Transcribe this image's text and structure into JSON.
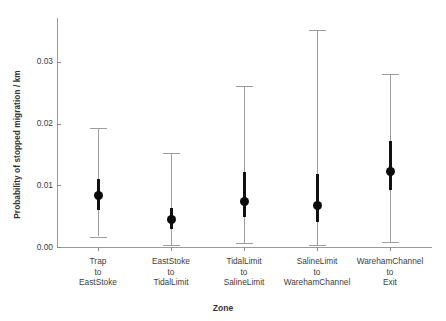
{
  "chart_data": {
    "type": "scatter",
    "title": "",
    "xlabel": "Zone",
    "ylabel": "Probability of stopped migration / km",
    "ylim": [
      0.0,
      0.0355
    ],
    "grid": false,
    "legend": "none",
    "ytick_labels": [
      "0.00",
      "0.01",
      "0.02",
      "0.03"
    ],
    "ytick_values": [
      0.0,
      0.01,
      0.02,
      0.03
    ],
    "categories": [
      "Trap to EastStoke",
      "EastStoke to TidalLimit",
      "TidalLimit to SalineLimit",
      "SalineLimit to WarehamChannel",
      "WarehamChannel to Exit"
    ],
    "category_lines": [
      [
        "Trap",
        "to",
        "EastStoke"
      ],
      [
        "EastStoke",
        "to",
        "TidalLimit"
      ],
      [
        "TidalLimit",
        "to",
        "SalineLimit"
      ],
      [
        "SalineLimit",
        "to",
        "WarehamChannel"
      ],
      [
        "WarehamChannel",
        "to",
        "Exit"
      ]
    ],
    "series": [
      {
        "name": "estimate",
        "values": [
          0.0083,
          0.0045,
          0.0074,
          0.0067,
          0.0122
        ]
      },
      {
        "name": "inner-interval",
        "lower": [
          0.006,
          0.0029,
          0.0048,
          0.004,
          0.0092
        ],
        "upper": [
          0.011,
          0.0064,
          0.0122,
          0.0118,
          0.0172
        ]
      },
      {
        "name": "outer-interval",
        "lower": [
          0.0017,
          0.0004,
          0.0006,
          0.0003,
          0.0008
        ],
        "upper": [
          0.0193,
          0.0153,
          0.0261,
          0.0352,
          0.0281
        ]
      }
    ],
    "colors": {
      "point": "#0a0a0a",
      "inner_bar": "#111111",
      "whisker": "#9d9d9d",
      "axis": "#9a9a9a",
      "text": "#3d3d3d",
      "background": "#ffffff"
    }
  }
}
